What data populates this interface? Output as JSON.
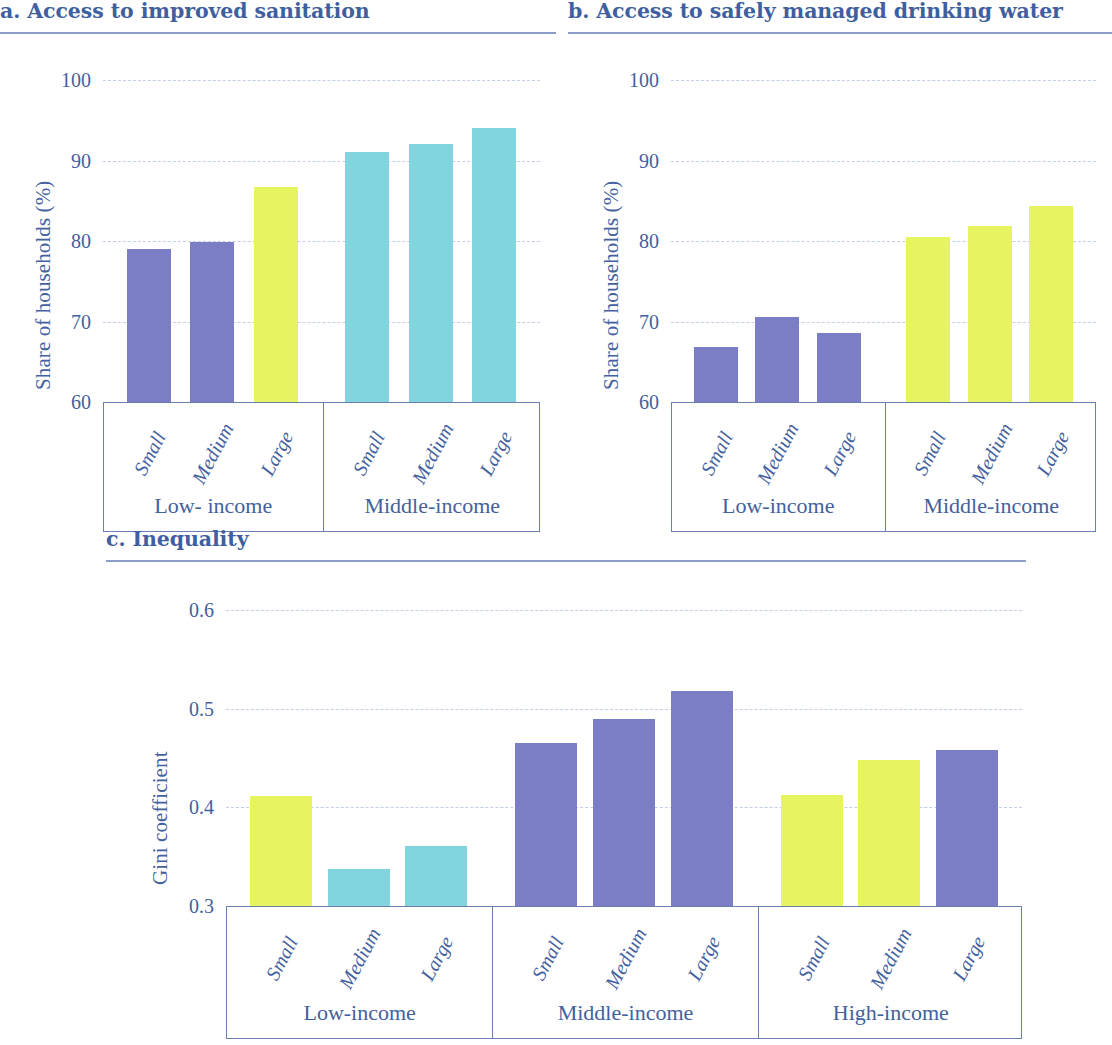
{
  "figure": {
    "panels": [
      {
        "id": "a",
        "title": "a. Access to improved sanitation"
      },
      {
        "id": "b",
        "title": "b. Access to safely managed drinking water"
      },
      {
        "id": "c",
        "title": "c. Inequality"
      }
    ]
  },
  "colors": {
    "purple": "#7b7ec4",
    "teal": "#82d5df",
    "yellow": "#e6f45f",
    "text_blue": "#44619e",
    "title_blue": "#3f5fa0",
    "rule": "#8b9dc8",
    "grid": "#c3cfe4",
    "frame": "#6b7fb5"
  },
  "chart_data": [
    {
      "id": "a",
      "type": "bar",
      "title": "a. Access to improved sanitation",
      "xlabel": "",
      "ylabel": "Share of households (%)",
      "ylim": [
        60,
        100
      ],
      "yticks": [
        "60",
        "70",
        "80",
        "90",
        "100"
      ],
      "ytick_values": [
        60,
        70,
        80,
        90,
        100
      ],
      "grid": true,
      "legend": "none",
      "categories": [
        "Small",
        "Medium",
        "Large",
        "Small",
        "Medium",
        "Large"
      ],
      "groups": [
        {
          "label": "Low- income",
          "categories": [
            "Small",
            "Medium",
            "Large"
          ]
        },
        {
          "label": "Middle-income",
          "categories": [
            "Small",
            "Medium",
            "Large"
          ]
        }
      ],
      "values": [
        79.0,
        79.9,
        86.7,
        91.0,
        92.1,
        94.1
      ],
      "bar_colors": [
        "#7b7ec4",
        "#7b7ec4",
        "#e6f45f",
        "#82d5df",
        "#82d5df",
        "#82d5df"
      ]
    },
    {
      "id": "b",
      "type": "bar",
      "title": "b. Access to safely managed drinking water",
      "xlabel": "",
      "ylabel": "Share of households (%)",
      "ylim": [
        60,
        100
      ],
      "yticks": [
        "60",
        "70",
        "80",
        "90",
        "100"
      ],
      "ytick_values": [
        60,
        70,
        80,
        90,
        100
      ],
      "grid": true,
      "legend": "none",
      "categories": [
        "Small",
        "Medium",
        "Large",
        "Small",
        "Medium",
        "Large"
      ],
      "groups": [
        {
          "label": "Low-income",
          "categories": [
            "Small",
            "Medium",
            "Large"
          ]
        },
        {
          "label": "Middle-income",
          "categories": [
            "Small",
            "Medium",
            "Large"
          ]
        }
      ],
      "values": [
        66.8,
        70.5,
        68.6,
        80.5,
        81.9,
        84.3
      ],
      "bar_colors": [
        "#7b7ec4",
        "#7b7ec4",
        "#7b7ec4",
        "#e6f45f",
        "#e6f45f",
        "#e6f45f"
      ]
    },
    {
      "id": "c",
      "type": "bar",
      "title": "c. Inequality",
      "xlabel": "",
      "ylabel": "Gini coefficient",
      "ylim": [
        0.3,
        0.6
      ],
      "yticks": [
        "0.3",
        "0.4",
        "0.5",
        "0.6"
      ],
      "ytick_values": [
        0.3,
        0.4,
        0.5,
        0.6
      ],
      "grid": true,
      "legend": "none",
      "categories": [
        "Small",
        "Medium",
        "Large",
        "Small",
        "Medium",
        "Large",
        "Small",
        "Medium",
        "Large"
      ],
      "groups": [
        {
          "label": "Low-income",
          "categories": [
            "Small",
            "Medium",
            "Large"
          ]
        },
        {
          "label": "Middle-income",
          "categories": [
            "Small",
            "Medium",
            "Large"
          ]
        },
        {
          "label": "High-income",
          "categories": [
            "Small",
            "Medium",
            "Large"
          ]
        }
      ],
      "values": [
        0.412,
        0.338,
        0.361,
        0.465,
        0.49,
        0.518,
        0.413,
        0.448,
        0.458
      ],
      "bar_colors": [
        "#e6f45f",
        "#82d5df",
        "#82d5df",
        "#7b7ec4",
        "#7b7ec4",
        "#7b7ec4",
        "#e6f45f",
        "#e6f45f",
        "#7b7ec4"
      ]
    }
  ]
}
